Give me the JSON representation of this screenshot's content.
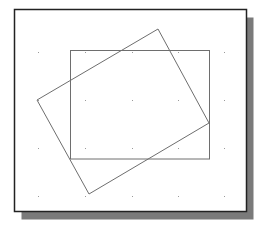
{
  "canvas": {
    "width": 258,
    "height": 228,
    "background": "#ffffff"
  },
  "frame": {
    "x": 14.5,
    "y": 9.5,
    "width": 232,
    "height": 202,
    "stroke": "#222222",
    "stroke_width": 1.5,
    "fill": "#ffffff",
    "shadow": {
      "offset_x": 7,
      "offset_y": 8,
      "color": "#7a7a7a"
    }
  },
  "grid": {
    "xs": [
      38,
      85,
      132,
      178,
      224
    ],
    "ys": [
      52,
      100,
      148,
      196
    ],
    "color": "#9a9a9a",
    "dot_size": 1
  },
  "shapes": [
    {
      "name": "axis-aligned-rectangle",
      "type": "rect",
      "x": 70.5,
      "y": 50.5,
      "width": 139,
      "height": 108.5,
      "stroke": "#6e6e6e",
      "stroke_width": 1
    },
    {
      "name": "rotated-rectangle",
      "type": "polygon",
      "points": [
        [
          158,
          29
        ],
        [
          209,
          123
        ],
        [
          89,
          194
        ],
        [
          37,
          100
        ]
      ],
      "stroke": "#6e6e6e",
      "stroke_width": 1
    }
  ]
}
